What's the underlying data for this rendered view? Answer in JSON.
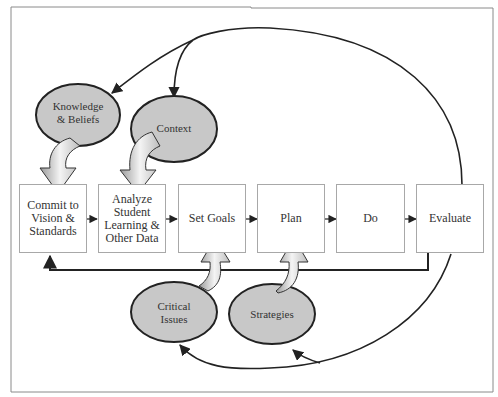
{
  "diagram": {
    "steps": [
      {
        "label": "Commit to Vision & Standards"
      },
      {
        "label": "Analyze Student Learning & Other Data"
      },
      {
        "label": "Set Goals"
      },
      {
        "label": "Plan"
      },
      {
        "label": "Do"
      },
      {
        "label": "Evaluate"
      }
    ],
    "influences": [
      {
        "label": "Knowledge & Beliefs"
      },
      {
        "label": "Context"
      },
      {
        "label": "Critical Issues"
      },
      {
        "label": "Strategies"
      }
    ],
    "colors": {
      "ellipse_fill": "#c8c8c8",
      "ellipse_stroke": "#222222",
      "box_border": "#a8a8a8",
      "frame_border": "#8a8a8a",
      "connector": "#222222"
    }
  }
}
